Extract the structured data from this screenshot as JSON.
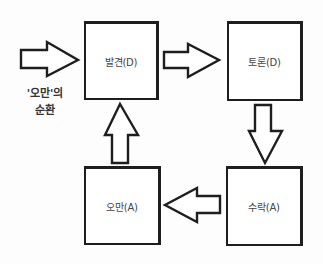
{
  "diagram": {
    "title_line1": "'오만'의",
    "title_line2": "순환",
    "nodes": [
      {
        "id": "discovery",
        "label": "발견(D)"
      },
      {
        "id": "discussion",
        "label": "토론(D)"
      },
      {
        "id": "acceptance",
        "label": "수락(A)"
      },
      {
        "id": "arrogance",
        "label": "오만(A)"
      }
    ],
    "edges": [
      {
        "from": "entry",
        "to": "discovery"
      },
      {
        "from": "discovery",
        "to": "discussion"
      },
      {
        "from": "discussion",
        "to": "acceptance"
      },
      {
        "from": "acceptance",
        "to": "arrogance"
      },
      {
        "from": "arrogance",
        "to": "discovery"
      }
    ]
  }
}
